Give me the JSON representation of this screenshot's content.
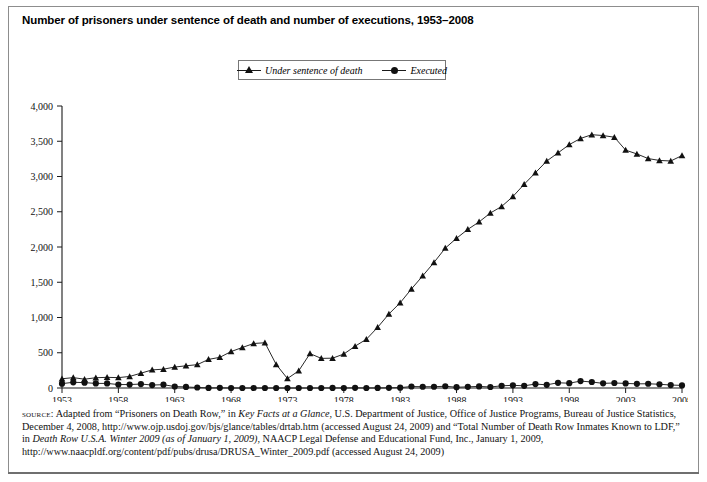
{
  "figure": {
    "title": "Number of prisoners under sentence of death and number of executions, 1953–2008"
  },
  "legend": {
    "position": "top-center",
    "items": [
      {
        "label": "Under sentence of death",
        "marker": "triangle-marker",
        "color": "#111111"
      },
      {
        "label": "Executed",
        "marker": "circle-marker",
        "color": "#111111"
      }
    ]
  },
  "source": {
    "label": "source:",
    "text_part_1": " Adapted from “Prisoners on Death Row,” in ",
    "italic_1": "Key Facts at a Glance",
    "text_part_2": ", U.S. Department of Justice, Office of Justice Programs, Bureau of Justice Statistics, December 4, 2008, http://www.ojp.usdoj.gov/bjs/glance/tables/drtab.htm (accessed August 24, 2009) and “Total Number of Death Row Inmates Known to LDF,” in ",
    "italic_2": "Death Row U.S.A. Winter 2009 (as of January 1, 2009)",
    "text_part_3": ", NAACP Legal Defense and Educational Fund, Inc., January 1, 2009, http://www.naacpldf.org/content/pdf/pubs/drusa/DRUSA_Winter_2009.pdf (accessed August 24, 2009)"
  },
  "chart_data": {
    "type": "line",
    "title": "Number of prisoners under sentence of death and number of executions, 1953–2008",
    "xlabel": "",
    "ylabel": "",
    "xlim": [
      1953,
      2008
    ],
    "ylim": [
      0,
      4000
    ],
    "ytick_values": [
      0,
      500,
      1000,
      1500,
      2000,
      2500,
      3000,
      3500,
      4000
    ],
    "ytick_labels": [
      "0",
      "500",
      "1,000",
      "1,500",
      "2,000",
      "2,500",
      "3,000",
      "3,500",
      "4,000"
    ],
    "xtick_values": [
      1953,
      1958,
      1963,
      1968,
      1973,
      1978,
      1983,
      1988,
      1993,
      1998,
      2003,
      2008
    ],
    "xtick_labels": [
      "1953",
      "1958",
      "1963",
      "1968",
      "1973",
      "1978",
      "1983",
      "1988",
      "1993",
      "1998",
      "2003",
      "2008"
    ],
    "grid": false,
    "legend_position": "top-center",
    "x": [
      1953,
      1954,
      1955,
      1956,
      1957,
      1958,
      1959,
      1960,
      1961,
      1962,
      1963,
      1964,
      1965,
      1966,
      1967,
      1968,
      1969,
      1970,
      1971,
      1972,
      1973,
      1974,
      1975,
      1976,
      1977,
      1978,
      1979,
      1980,
      1981,
      1982,
      1983,
      1984,
      1985,
      1986,
      1987,
      1988,
      1989,
      1990,
      1991,
      1992,
      1993,
      1994,
      1995,
      1996,
      1997,
      1998,
      1999,
      2000,
      2001,
      2002,
      2003,
      2004,
      2005,
      2006,
      2007,
      2008
    ],
    "series": [
      {
        "name": "Under sentence of death",
        "marker": "triangle",
        "color": "#111111",
        "values": [
          131,
          147,
          125,
          146,
          151,
          147,
          164,
          210,
          257,
          267,
          297,
          315,
          331,
          406,
          435,
          517,
          575,
          631,
          642,
          334,
          134,
          244,
          488,
          420,
          423,
          482,
          593,
          691,
          860,
          1050,
          1209,
          1405,
          1591,
          1781,
          1984,
          2124,
          2250,
          2356,
          2482,
          2575,
          2716,
          2890,
          3054,
          3219,
          3335,
          3452,
          3540,
          3593,
          3581,
          3557,
          3374,
          3320,
          3254,
          3228,
          3220,
          3297
        ]
      },
      {
        "name": "Executed",
        "marker": "circle",
        "color": "#111111",
        "values": [
          62,
          81,
          76,
          65,
          65,
          49,
          49,
          56,
          42,
          47,
          21,
          15,
          7,
          1,
          2,
          0,
          0,
          0,
          0,
          0,
          0,
          0,
          0,
          0,
          1,
          0,
          2,
          0,
          1,
          2,
          5,
          21,
          18,
          18,
          25,
          11,
          16,
          23,
          14,
          31,
          38,
          31,
          56,
          45,
          74,
          68,
          98,
          85,
          66,
          71,
          65,
          59,
          60,
          53,
          42,
          37
        ]
      }
    ]
  }
}
